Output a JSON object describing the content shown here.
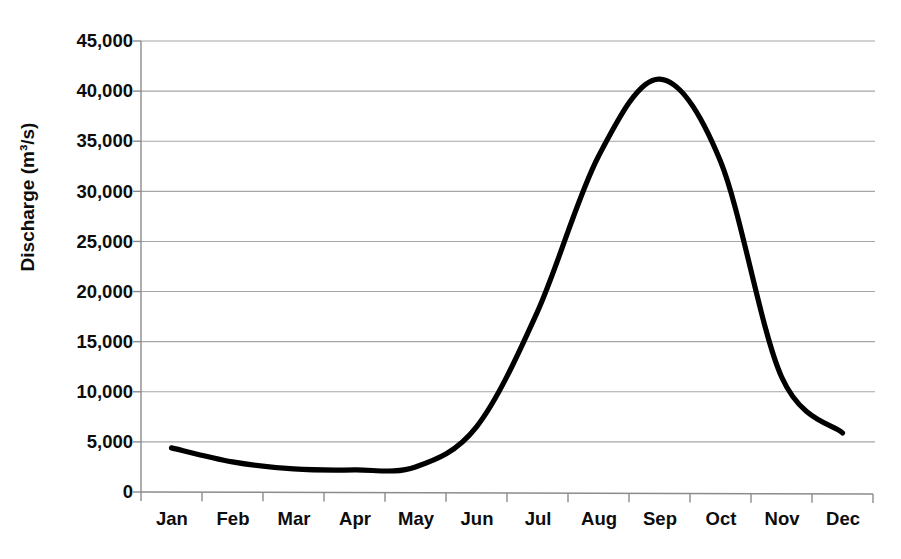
{
  "chart_data": {
    "type": "line",
    "title": "",
    "xlabel": "",
    "ylabel": "Discharge (m³/s)",
    "categories": [
      "Jan",
      "Feb",
      "Mar",
      "Apr",
      "May",
      "Jun",
      "Jul",
      "Aug",
      "Sep",
      "Oct",
      "Nov",
      "Dec"
    ],
    "values": [
      4400,
      3000,
      2300,
      2200,
      2500,
      6500,
      18000,
      33500,
      41200,
      33000,
      11500,
      5900
    ],
    "ylim": [
      0,
      45000
    ],
    "yticks": [
      0,
      5000,
      10000,
      15000,
      20000,
      25000,
      30000,
      35000,
      40000,
      45000
    ],
    "ytick_labels": [
      "0",
      "5,000",
      "10,000",
      "15,000",
      "20,000",
      "25,000",
      "30,000",
      "35,000",
      "40,000",
      "45,000"
    ],
    "grid": "horizontal",
    "legend": "none",
    "series": [
      {
        "name": "Discharge",
        "color": "#000000",
        "line_width": 5,
        "values": [
          4400,
          3000,
          2300,
          2200,
          2500,
          6500,
          18000,
          33500,
          41200,
          33000,
          11500,
          5900
        ]
      }
    ],
    "notes": {
      "peak_value": 41200,
      "peak_month": "Sep",
      "minimum_value": 2200,
      "minimum_month": "Apr"
    }
  },
  "axes": {
    "y_axis_title": "Discharge (m³/s)",
    "x_axis_title": ""
  },
  "colors": {
    "line": "#000000",
    "grid": "#a6a6a6",
    "axis": "#8c8c8c",
    "text": "#0d0d0d",
    "background": "#ffffff"
  }
}
